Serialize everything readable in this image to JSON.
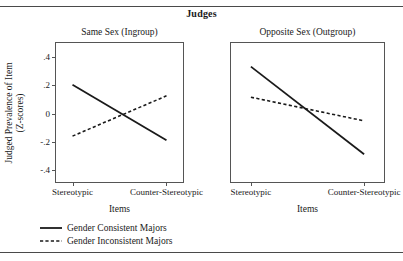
{
  "figure": {
    "title": "Judges",
    "y_axis_title_line1": "Judged Prevalence of Item",
    "y_axis_title_line2": "(Z-scores)",
    "x_axis_title": "Items"
  },
  "legend": {
    "items": [
      {
        "label": "Gender Consistent Majors",
        "style": "solid"
      },
      {
        "label": "Gender Inconsistent Majors",
        "style": "dashed"
      }
    ]
  },
  "panels": {
    "left_title": "Same Sex (Ingroup)",
    "right_title": "Opposite Sex (Outgroup)"
  },
  "axis": {
    "y_ticks": [
      ".4",
      ".2",
      "0",
      "-.2",
      "-.4"
    ],
    "x_ticks": [
      "Stereotypic",
      "Counter-Stereotypic"
    ]
  },
  "chart_data": {
    "type": "line",
    "title": "Judges",
    "xlabel": "Items",
    "ylabel": "Judged Prevalence of Item (Z-scores)",
    "categories": [
      "Stereotypic",
      "Counter-Stereotypic"
    ],
    "ylim": [
      -0.5,
      0.5
    ],
    "ytick_values": [
      0.4,
      0.2,
      0,
      -0.2,
      -0.4
    ],
    "ytick_labels": [
      ".4",
      ".2",
      "0",
      "-.2",
      "-.4"
    ],
    "grid": false,
    "legend_position": "bottom-left",
    "panels": [
      {
        "name": "Same Sex (Ingroup)",
        "series": [
          {
            "name": "Gender Consistent Majors",
            "style": "solid",
            "values": [
              0.2,
              -0.2
            ]
          },
          {
            "name": "Gender Inconsistent Majors",
            "style": "dashed",
            "values": [
              -0.17,
              0.12
            ]
          }
        ]
      },
      {
        "name": "Opposite Sex (Outgroup)",
        "series": [
          {
            "name": "Gender Consistent Majors",
            "style": "solid",
            "values": [
              0.33,
              -0.3
            ]
          },
          {
            "name": "Gender Inconsistent Majors",
            "style": "dashed",
            "values": [
              0.11,
              -0.06
            ]
          }
        ]
      }
    ]
  }
}
